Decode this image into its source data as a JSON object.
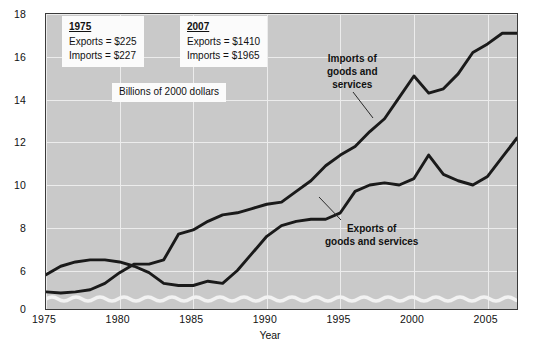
{
  "chart_data": {
    "type": "line",
    "title": "",
    "xlabel": "Year",
    "ylabel": "Percentage of GDP",
    "units_note": "Billions of 2000 dollars",
    "xlim": [
      1975,
      2007
    ],
    "ylim": [
      4.2,
      18
    ],
    "y_axis_broken": true,
    "grid": true,
    "legend_position": "inline-callouts",
    "yticks": [
      "0",
      "6",
      "8",
      "10",
      "12",
      "14",
      "16",
      "18"
    ],
    "ytick_values": [
      0,
      6,
      8,
      10,
      12,
      14,
      16,
      18
    ],
    "xticks": [
      "1975",
      "1980",
      "1985",
      "1990",
      "1995",
      "2000",
      "2005"
    ],
    "xtick_values": [
      1975,
      1980,
      1985,
      1990,
      1995,
      2000,
      2005
    ],
    "x": [
      1975,
      1976,
      1977,
      1978,
      1979,
      1980,
      1981,
      1982,
      1983,
      1984,
      1985,
      1986,
      1987,
      1988,
      1989,
      1990,
      1991,
      1992,
      1993,
      1994,
      1995,
      1996,
      1997,
      1998,
      1999,
      2000,
      2001,
      2002,
      2003,
      2004,
      2005,
      2006,
      2007
    ],
    "series": [
      {
        "name": "Imports of goods and services",
        "color": "#1a1a1a",
        "values": [
          5.0,
          4.95,
          5.0,
          5.1,
          5.4,
          5.9,
          6.3,
          6.3,
          6.5,
          7.7,
          7.9,
          8.3,
          8.6,
          8.7,
          8.9,
          9.1,
          9.2,
          9.7,
          10.2,
          10.9,
          11.4,
          11.8,
          12.5,
          13.1,
          14.1,
          15.1,
          14.3,
          14.5,
          15.2,
          16.2,
          16.6,
          17.1,
          17.1
        ]
      },
      {
        "name": "Exports of goods and services",
        "color": "#1a1a1a",
        "values": [
          5.8,
          6.2,
          6.4,
          6.5,
          6.5,
          6.4,
          6.2,
          5.9,
          5.4,
          5.3,
          5.3,
          5.5,
          5.4,
          6.0,
          6.8,
          7.6,
          8.1,
          8.3,
          8.4,
          8.4,
          8.7,
          9.7,
          10.0,
          10.1,
          10.0,
          10.3,
          11.4,
          10.5,
          10.2,
          10.0,
          10.4,
          11.3,
          12.2
        ]
      }
    ],
    "annotations": [
      {
        "id": "1975",
        "year_label": "1975",
        "rows": [
          "Exports = $225",
          "Imports = $227"
        ]
      },
      {
        "id": "2007",
        "year_label": "2007",
        "rows": [
          "Exports = $1410",
          "Imports = $1965"
        ]
      }
    ],
    "callouts": [
      {
        "id": "imports",
        "lines": [
          "Imports of",
          "goods and",
          "services"
        ]
      },
      {
        "id": "exports",
        "lines": [
          "Exports of",
          "goods and services"
        ]
      }
    ],
    "colors": {
      "plot_background": "#c9c9c9",
      "gridline": "#ececec",
      "line": "#1a1a1a",
      "axis_break": "#f2f2f2",
      "frame": "#3a3a3a",
      "text": "#111111",
      "annotation_background": "#fbfbfb"
    }
  }
}
